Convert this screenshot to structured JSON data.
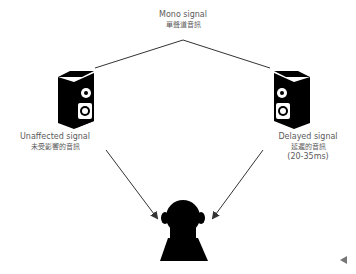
{
  "diagram": {
    "top_label": {
      "en": "Mono signal",
      "zh": "單聲道音訊"
    },
    "left_speaker": {
      "en": "Unaffected signal",
      "zh": "未受影響的音訊"
    },
    "right_speaker": {
      "en": "Delayed signal",
      "zh": "延遲的音訊",
      "detail": "(20-35ms)"
    },
    "listener": "listener-icon",
    "icons": [
      "speaker-icon",
      "speaker-icon",
      "person-icon",
      "arrow-left-icon"
    ],
    "colors": {
      "line": "#333333",
      "icon": "#000000",
      "text": "#5a5a5a",
      "nav": "#777777"
    }
  },
  "nav": {
    "prev_icon": "triangle-left"
  }
}
